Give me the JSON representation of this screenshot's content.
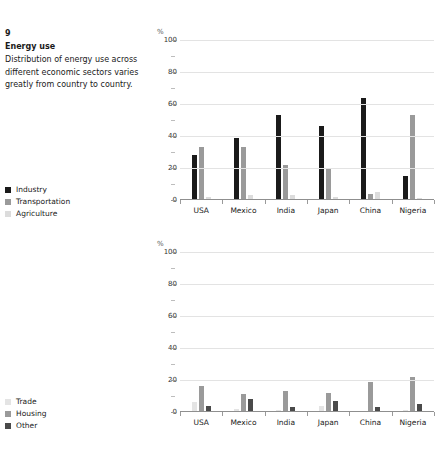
{
  "figure": {
    "number": "9",
    "title": "Energy use",
    "description": "Distribution of energy use across different economic sectors varies greatly from country to country."
  },
  "legends": {
    "top": {
      "items": [
        {
          "label": "Industry",
          "color": "#1a1a1a"
        },
        {
          "label": "Transportation",
          "color": "#9a9a9a"
        },
        {
          "label": "Agriculture",
          "color": "#dcdcdc"
        }
      ]
    },
    "bottom": {
      "items": [
        {
          "label": "Trade",
          "color": "#e4e4e4"
        },
        {
          "label": "Housing",
          "color": "#9a9a9a"
        },
        {
          "label": "Other",
          "color": "#4a4a4a"
        }
      ]
    }
  },
  "chart_data": [
    {
      "type": "bar",
      "id": "energy-use-top",
      "title": "Energy use",
      "xlabel": "",
      "ylabel": "%",
      "unit_label": "%",
      "ylim": [
        0,
        100
      ],
      "yticks": [
        0,
        20,
        40,
        60,
        80,
        100
      ],
      "grid": true,
      "legend_position": "left",
      "categories": [
        "USA",
        "Mexico",
        "India",
        "Japan",
        "China",
        "Nigeria"
      ],
      "series": [
        {
          "name": "Industry",
          "color": "#1a1a1a",
          "values": [
            28,
            39,
            53,
            46,
            64,
            15
          ]
        },
        {
          "name": "Transportation",
          "color": "#9a9a9a",
          "values": [
            33,
            33,
            22,
            20,
            4,
            53
          ]
        },
        {
          "name": "Agriculture",
          "color": "#dcdcdc",
          "values": [
            2,
            3,
            3,
            2,
            5,
            1
          ]
        }
      ]
    },
    {
      "type": "bar",
      "id": "energy-use-bottom",
      "title": "",
      "xlabel": "",
      "ylabel": "%",
      "unit_label": "%",
      "ylim": [
        0,
        100
      ],
      "yticks": [
        0,
        20,
        40,
        60,
        80,
        100
      ],
      "grid": true,
      "legend_position": "left",
      "categories": [
        "USA",
        "Mexico",
        "India",
        "Japan",
        "China",
        "Nigeria"
      ],
      "series": [
        {
          "name": "Trade",
          "color": "#e4e4e4",
          "values": [
            6,
            2,
            1,
            4,
            0,
            1
          ]
        },
        {
          "name": "Housing",
          "color": "#9a9a9a",
          "values": [
            16,
            11,
            13,
            12,
            19,
            22
          ]
        },
        {
          "name": "Other",
          "color": "#4a4a4a",
          "values": [
            4,
            8,
            3,
            7,
            3,
            5
          ]
        }
      ]
    }
  ]
}
